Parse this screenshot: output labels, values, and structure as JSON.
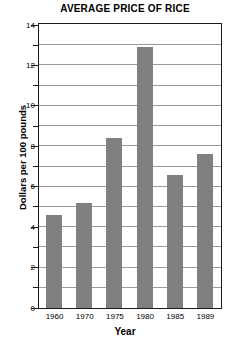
{
  "chart_data": {
    "type": "bar",
    "title": "AVERAGE PRICE OF RICE",
    "xlabel": "Year",
    "ylabel": "Dollars per 100 pounds",
    "categories": [
      "1960",
      "1970",
      "1975",
      "1980",
      "1985",
      "1989"
    ],
    "values": [
      4.6,
      5.2,
      8.4,
      12.9,
      6.6,
      7.6
    ],
    "ylim": [
      0,
      14
    ],
    "ytick_major": [
      0,
      2,
      4,
      6,
      8,
      10,
      12,
      14
    ],
    "ytick_major_labels": [
      "0",
      "2",
      "4",
      "6",
      "8",
      "10",
      "12",
      "14"
    ],
    "ytick_minor": [
      1,
      3,
      5,
      7,
      9,
      11,
      13
    ],
    "grid": true,
    "grid_axis": "y",
    "legend": false,
    "bar_color": "#808080",
    "grid_color": "#9a9a9a",
    "axis_color": "#1a1a1a",
    "background": "#ffffff"
  }
}
